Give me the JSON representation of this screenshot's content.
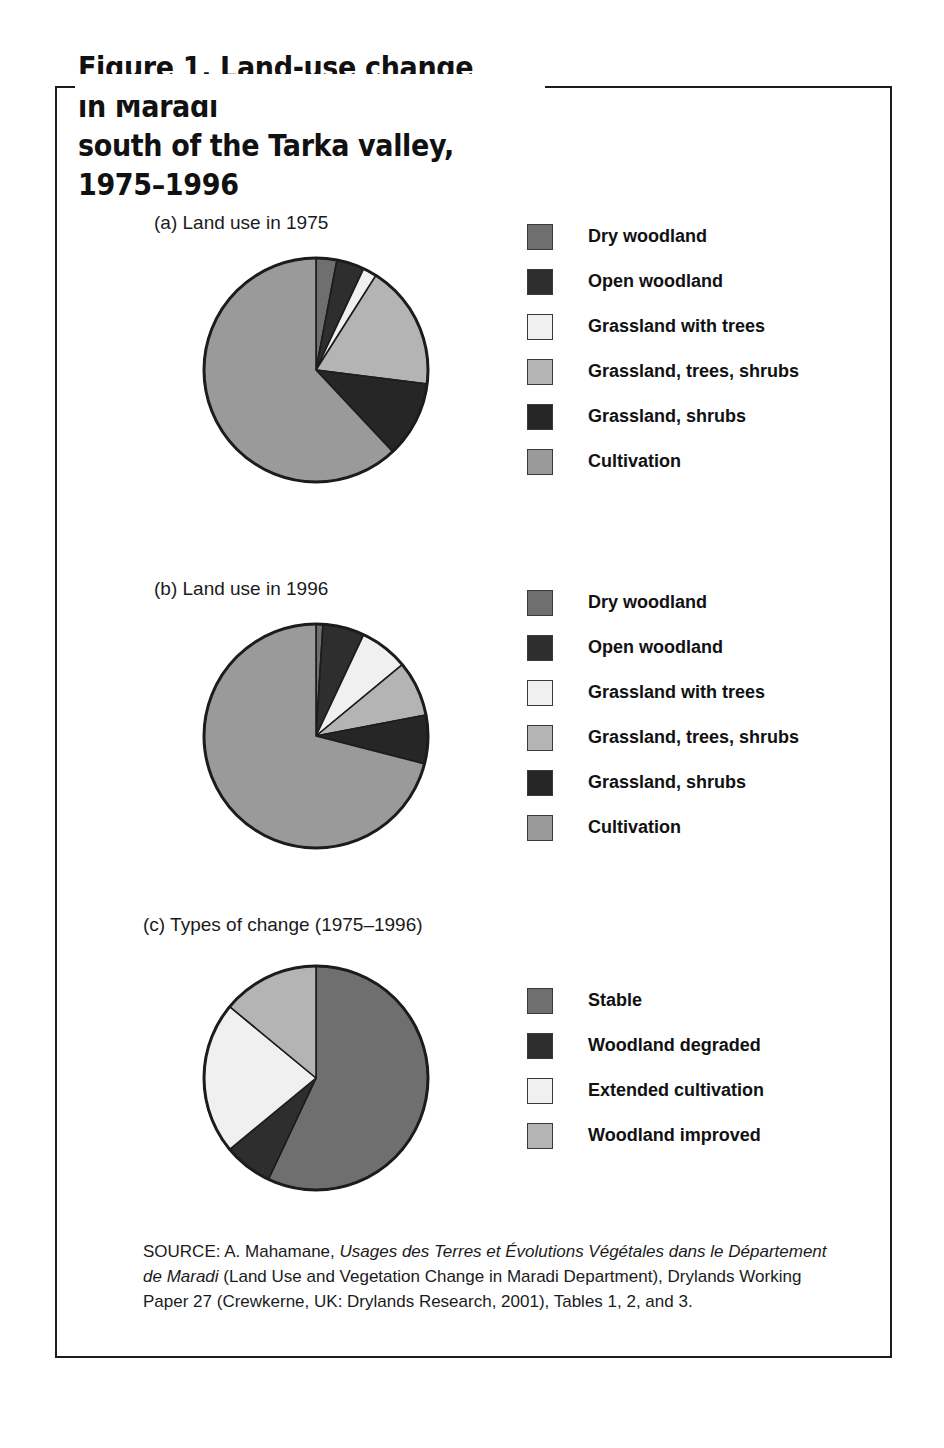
{
  "figure": {
    "title": "Figure 1. Land-use change in Maradi\nsouth of the Tarka valley, 1975–1996",
    "source": "SOURCE: A. Mahamane, |Usages des Terres et Évolutions Végétales dans le Département de Maradi| (Land Use and Vegetation Change in Maradi Department), Drylands Working Paper 27 (Crewkerne, UK: Drylands Research, 2001), Tables 1, 2, and 3."
  },
  "colors": {
    "dry_woodland": "#6f6f6f",
    "open_woodland": "#2e2e2e",
    "grassland_with_trees": "#f0f0f0",
    "grassland_trees_shrubs": "#b4b4b4",
    "grassland_shrubs": "#262626",
    "cultivation": "#9a9a9a",
    "stable": "#6f6f6f",
    "woodland_degraded": "#2e2e2e",
    "extended_cultivation": "#f0f0f0",
    "woodland_improved": "#b4b4b4",
    "outline": "#1c1c1c",
    "frame": "#1c1c1c"
  },
  "chart_data": [
    {
      "type": "pie",
      "id": "a",
      "title": "(a) Land use in 1975",
      "categories": [
        "Dry woodland",
        "Open woodland",
        "Grassland with trees",
        "Grassland, trees, shrubs",
        "Grassland, shrubs",
        "Cultivation"
      ],
      "values": [
        3,
        4,
        2,
        18,
        11,
        62
      ],
      "units": "percent",
      "start_angle": 0,
      "direction": "clockwise",
      "legend_position": "right",
      "legend": [
        {
          "label": "Dry woodland",
          "color": "#6f6f6f"
        },
        {
          "label": "Open woodland",
          "color": "#2e2e2e"
        },
        {
          "label": "Grassland with trees",
          "color": "#f0f0f0"
        },
        {
          "label": "Grassland, trees, shrubs",
          "color": "#b4b4b4"
        },
        {
          "label": "Grassland, shrubs",
          "color": "#262626"
        },
        {
          "label": "Cultivation",
          "color": "#9a9a9a"
        }
      ]
    },
    {
      "type": "pie",
      "id": "b",
      "title": "(b) Land use in 1996",
      "categories": [
        "Dry woodland",
        "Open woodland",
        "Grassland with trees",
        "Grassland, trees, shrubs",
        "Grassland, shrubs",
        "Cultivation"
      ],
      "values": [
        1,
        6,
        7,
        8,
        7,
        71
      ],
      "units": "percent",
      "start_angle": 0,
      "direction": "clockwise",
      "legend_position": "right",
      "legend": [
        {
          "label": "Dry woodland",
          "color": "#6f6f6f"
        },
        {
          "label": "Open woodland",
          "color": "#2e2e2e"
        },
        {
          "label": "Grassland with trees",
          "color": "#f0f0f0"
        },
        {
          "label": "Grassland, trees, shrubs",
          "color": "#b4b4b4"
        },
        {
          "label": "Grassland, shrubs",
          "color": "#262626"
        },
        {
          "label": "Cultivation",
          "color": "#9a9a9a"
        }
      ]
    },
    {
      "type": "pie",
      "id": "c",
      "title": "(c) Types of change (1975–1996)",
      "categories": [
        "Stable",
        "Woodland degraded",
        "Extended cultivation",
        "Woodland improved"
      ],
      "values": [
        57,
        7,
        22,
        14
      ],
      "units": "percent",
      "start_angle": 0,
      "direction": "clockwise",
      "legend_position": "right",
      "legend": [
        {
          "label": "Stable",
          "color": "#6f6f6f"
        },
        {
          "label": "Woodland degraded",
          "color": "#2e2e2e"
        },
        {
          "label": "Extended cultivation",
          "color": "#f0f0f0"
        },
        {
          "label": "Woodland improved",
          "color": "#b4b4b4"
        }
      ]
    }
  ]
}
